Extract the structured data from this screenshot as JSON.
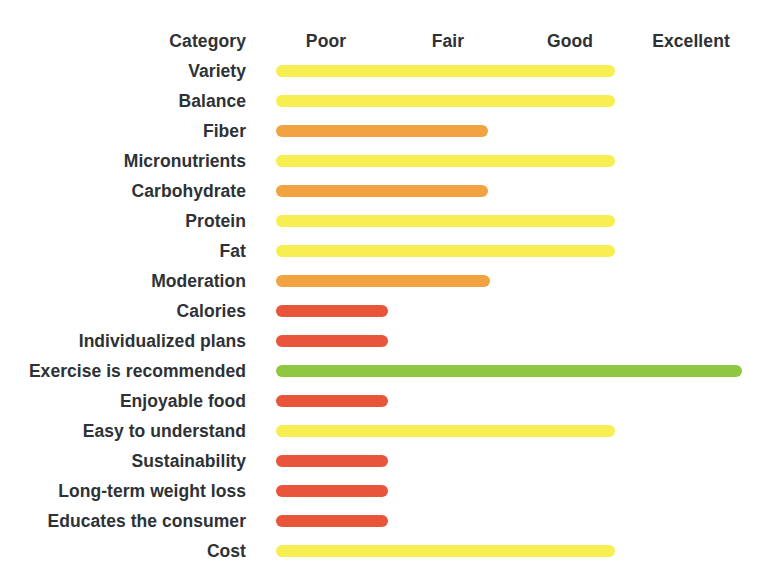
{
  "header": {
    "category_label": "Category",
    "scale": [
      "Poor",
      "Fair",
      "Good",
      "Excellent"
    ]
  },
  "colors": {
    "poor": "#E8553A",
    "fair": "#F2A341",
    "good": "#F7EE52",
    "excellent": "#8FC740",
    "text": "#2E3236",
    "background": "#FFFFFF"
  },
  "chart_data": {
    "type": "bar",
    "title": "",
    "subtitle": "",
    "xlabel": "",
    "ylabel": "Category",
    "orientation": "horizontal",
    "grid": false,
    "legend_position": "top",
    "legend": [
      "Poor",
      "Fair",
      "Good",
      "Excellent"
    ],
    "xlim": [
      0,
      4
    ],
    "xtick_labels": [
      "Poor",
      "Fair",
      "Good",
      "Excellent"
    ],
    "xtick_values": [
      0.5,
      1.5,
      2.5,
      3.5
    ],
    "categories": [
      "Variety",
      "Balance",
      "Fiber",
      "Micronutrients",
      "Carbohydrate",
      "Protein",
      "Fat",
      "Moderation",
      "Calories",
      "Individualized plans",
      "Exercise is recommended",
      "Enjoyable food",
      "Easy to understand",
      "Sustainability",
      "Long-term weight loss",
      "Educates the consumer",
      "Cost"
    ],
    "values": [
      2.9,
      2.9,
      1.8,
      2.9,
      1.8,
      2.9,
      2.9,
      1.82,
      0.95,
      0.95,
      3.97,
      0.95,
      2.9,
      0.95,
      0.95,
      0.95,
      2.9
    ],
    "ratings": [
      "Good",
      "Good",
      "Fair",
      "Good",
      "Fair",
      "Good",
      "Good",
      "Fair",
      "Poor",
      "Poor",
      "Excellent",
      "Poor",
      "Good",
      "Poor",
      "Poor",
      "Poor",
      "Good"
    ],
    "bar_colors": [
      "#F7EE52",
      "#F7EE52",
      "#F2A341",
      "#F7EE52",
      "#F2A341",
      "#F7EE52",
      "#F7EE52",
      "#F2A341",
      "#E8553A",
      "#E8553A",
      "#8FC740",
      "#E8553A",
      "#F7EE52",
      "#E8553A",
      "#E8553A",
      "#E8553A",
      "#F7EE52"
    ],
    "bar_widths_px": [
      339,
      339,
      212,
      339,
      212,
      339,
      339,
      214,
      112,
      112,
      466,
      112,
      339,
      112,
      112,
      112,
      339
    ]
  }
}
